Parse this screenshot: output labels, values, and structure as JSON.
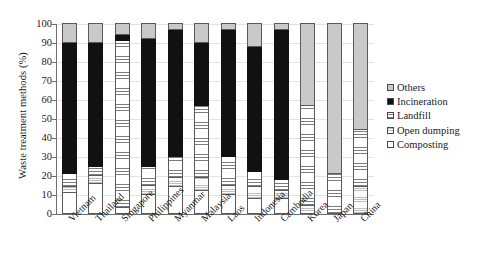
{
  "chart_data": {
    "type": "bar",
    "subtype": "stacked-bar-vertical",
    "title": "",
    "xlabel": "",
    "ylabel": "Waste treatment methods (%)",
    "ylim": [
      0,
      100
    ],
    "ytick_labels": [
      "0",
      "10",
      "20",
      "30",
      "40",
      "50",
      "60",
      "70",
      "80",
      "90",
      "100"
    ],
    "ytick_values": [
      0,
      10,
      20,
      30,
      40,
      50,
      60,
      70,
      80,
      90,
      100
    ],
    "grid": true,
    "legend_position": "right",
    "stack_order_bottom_to_top": [
      "Composting",
      "Open dumping",
      "Landfill",
      "Incineration",
      "Others"
    ],
    "categories": [
      "Vietnam",
      "Thailand",
      "Singapore",
      "Philippines",
      "Myanmar",
      "Malaysia",
      "Laos",
      "Indonesia",
      "Cambodia",
      "Korea",
      "Japan",
      "China"
    ],
    "series": [
      {
        "name": "Composting",
        "values": [
          11,
          16,
          3,
          10,
          14,
          12,
          10,
          8,
          8,
          0,
          0,
          0
        ]
      },
      {
        "name": "Open dumping",
        "values": [
          3,
          4,
          0,
          5,
          5,
          7,
          5,
          6,
          4,
          4,
          0,
          14
        ]
      },
      {
        "name": "Landfill",
        "values": [
          7,
          5,
          88,
          10,
          11,
          38,
          15,
          8,
          6,
          53,
          21,
          30
        ]
      },
      {
        "name": "Incineration",
        "values": [
          69,
          65,
          3,
          67,
          67,
          33,
          67,
          66,
          79,
          0,
          0,
          0
        ]
      },
      {
        "name": "Others",
        "values": [
          10,
          10,
          6,
          8,
          3,
          10,
          3,
          12,
          3,
          43,
          79,
          56
        ]
      }
    ]
  },
  "legend": {
    "items": [
      {
        "label": "Others",
        "swatch": "others-swatch"
      },
      {
        "label": "Incineration",
        "swatch": "incineration-swatch"
      },
      {
        "label": "Landfill",
        "swatch": "landfill-swatch"
      },
      {
        "label": "Open dumping",
        "swatch": "open-dumping-swatch"
      },
      {
        "label": "Composting",
        "swatch": "composting-swatch"
      }
    ]
  }
}
